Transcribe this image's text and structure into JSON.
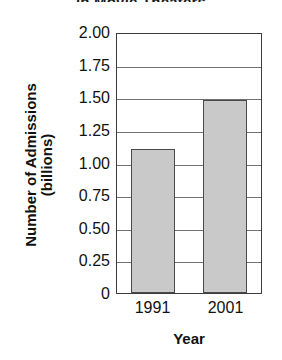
{
  "chart_data": {
    "type": "bar",
    "title": "in Movie Theaters",
    "categories": [
      "1991",
      "2001"
    ],
    "values": [
      1.1,
      1.48
    ],
    "xlabel": "Year",
    "ylabel": "Number of Admissions (billions)",
    "ylabel_lines": [
      "Number of Admissions",
      "(billions)"
    ],
    "ylim": [
      0,
      2.0
    ],
    "ytick_labels": [
      "2.00",
      "1.75",
      "1.50",
      "1.25",
      "1.00",
      "0.75",
      "0.50",
      "0.25",
      "0"
    ],
    "ytick_values": [
      2.0,
      1.75,
      1.5,
      1.25,
      1.0,
      0.75,
      0.5,
      0.25,
      0
    ],
    "grid": true,
    "legend": null,
    "bar_color": "#c9c9c9",
    "bar_edge_color": "#4a4a4a",
    "axis_color": "#3c3c3c",
    "gridline_color": "#707070"
  }
}
